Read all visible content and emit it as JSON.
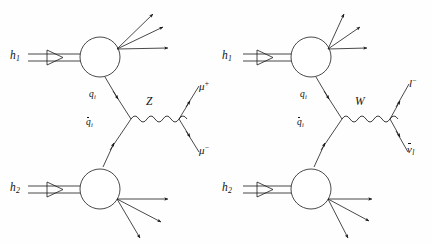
{
  "figure": {
    "kind": "feynman-diagram-pair",
    "ink_color": "#1a1a1a",
    "background_color": "#ffffff"
  },
  "diagrams": [
    {
      "id": "z-production",
      "boson": "Z",
      "incoming": [
        {
          "name": "hadron-1",
          "base": "h",
          "sub": "1"
        },
        {
          "name": "hadron-2",
          "base": "h",
          "sub": "2"
        }
      ],
      "partons": [
        {
          "name": "quark",
          "base": "q",
          "sub": "i",
          "bar": false
        },
        {
          "name": "antiquark",
          "base": "q",
          "sub": "i",
          "bar": true
        }
      ],
      "propagator": {
        "label": "Z",
        "style": "wavy"
      },
      "outgoing": [
        {
          "name": "muon-plus",
          "base": "μ",
          "sup": "+"
        },
        {
          "name": "muon-minus",
          "base": "μ",
          "sup": "−"
        }
      ],
      "remnant_jets_upper": 3,
      "remnant_jets_lower": 3
    },
    {
      "id": "w-production",
      "boson": "W",
      "incoming": [
        {
          "name": "hadron-1",
          "base": "h",
          "sub": "1"
        },
        {
          "name": "hadron-2",
          "base": "h",
          "sub": "2"
        }
      ],
      "partons": [
        {
          "name": "quark",
          "base": "q",
          "sub": "i",
          "bar": false
        },
        {
          "name": "antiquark",
          "base": "q",
          "sub": "i",
          "bar": true
        }
      ],
      "propagator": {
        "label": "W",
        "style": "wavy"
      },
      "outgoing": [
        {
          "name": "lepton-minus",
          "base": "l",
          "sup": "−"
        },
        {
          "name": "antineutrino",
          "base": "ν",
          "sub": "l",
          "bar": true
        }
      ],
      "remnant_jets_upper": 3,
      "remnant_jets_lower": 3
    }
  ],
  "labels": {
    "left": {
      "h1": "h",
      "h1_sub": "1",
      "h2": "h",
      "h2_sub": "2",
      "q": "q",
      "q_sub": "i",
      "qbar": "q",
      "qbar_sub": "i",
      "boson": "Z",
      "out_top": "μ",
      "out_top_sup": "+",
      "out_bot": "μ",
      "out_bot_sup": "−"
    },
    "right": {
      "h1": "h",
      "h1_sub": "1",
      "h2": "h",
      "h2_sub": "2",
      "q": "q",
      "q_sub": "i",
      "qbar": "q",
      "qbar_sub": "i",
      "boson": "W",
      "out_top": "l",
      "out_top_sup": "−",
      "out_bot": "ν",
      "out_bot_sub": "l"
    }
  }
}
